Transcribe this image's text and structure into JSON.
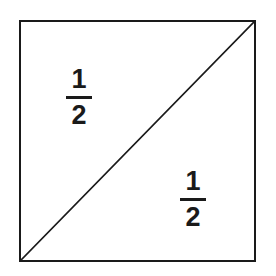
{
  "figure": {
    "background_color": "#ffffff",
    "ink_color": "#1a1a1a",
    "shape": {
      "name": "square",
      "border_width_px": 2.5,
      "left_px": 19,
      "top_px": 20,
      "width_px": 237,
      "height_px": 242
    },
    "diagonal": {
      "name": "diagonal-line",
      "from": "bottom-left",
      "to": "top-right",
      "stroke_width_px": 1.6,
      "x1": 21,
      "y1": 260,
      "x2": 254,
      "y2": 22
    },
    "labels": [
      {
        "id": "upper-left-half",
        "region": "upper-left triangle",
        "numerator": "1",
        "denominator": "2",
        "value": "1/2"
      },
      {
        "id": "lower-right-half",
        "region": "lower-right triangle",
        "numerator": "1",
        "denominator": "2",
        "value": "1/2"
      }
    ]
  }
}
